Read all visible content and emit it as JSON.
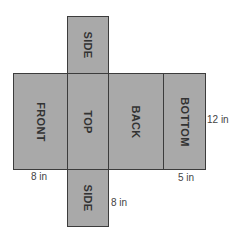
{
  "diagram": {
    "type": "rectangular prism net",
    "faces": [
      {
        "id": "side-top",
        "label": "SIDE"
      },
      {
        "id": "front",
        "label": "FRONT"
      },
      {
        "id": "top",
        "label": "TOP"
      },
      {
        "id": "back",
        "label": "BACK"
      },
      {
        "id": "bottom",
        "label": "BOTTOM"
      },
      {
        "id": "side-bottom",
        "label": "SIDE"
      }
    ],
    "dimensions": {
      "height": "12 in",
      "front_width": "8 in",
      "bottom_width": "5 in",
      "side_height": "8 in"
    },
    "colors": {
      "face_fill": "#a9a9a9",
      "border": "#3c3c3c",
      "text": "#333333"
    }
  }
}
